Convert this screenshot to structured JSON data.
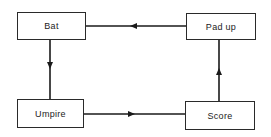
{
  "diagram": {
    "type": "cycle-flowchart",
    "nodes": [
      {
        "id": "bat",
        "label": "Bat"
      },
      {
        "id": "pad_up",
        "label": "Pad up"
      },
      {
        "id": "umpire",
        "label": "Umpire"
      },
      {
        "id": "score",
        "label": "Score"
      }
    ],
    "edges": [
      {
        "from": "pad_up",
        "to": "bat"
      },
      {
        "from": "bat",
        "to": "umpire"
      },
      {
        "from": "umpire",
        "to": "score"
      },
      {
        "from": "score",
        "to": "pad_up"
      }
    ],
    "colors": {
      "line": "#1a1a1a",
      "box_border": "#2a2a2a",
      "background": "#ffffff"
    }
  }
}
